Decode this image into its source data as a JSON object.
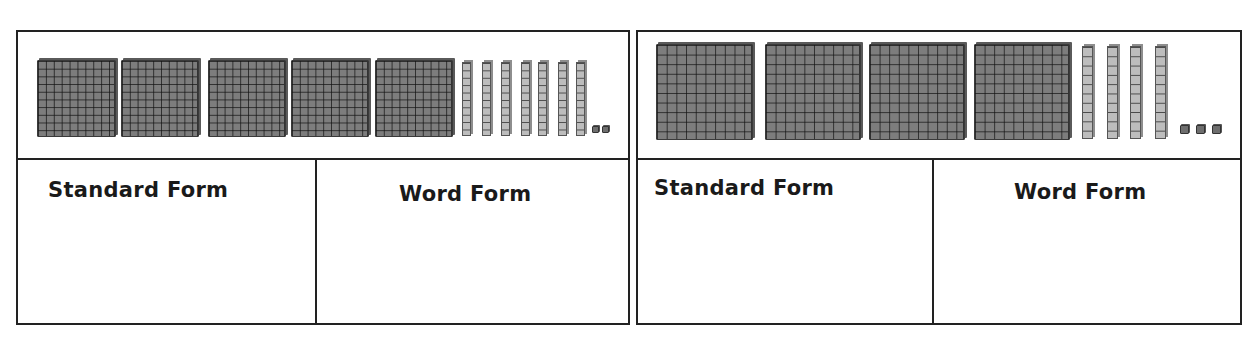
{
  "cards": [
    {
      "id": "left",
      "represented_number": 572,
      "blocks": {
        "hundreds": 5,
        "tens": 7,
        "ones": 2
      },
      "standard_form_label": "Standard Form",
      "word_form_label": "Word Form",
      "standard_form_value": "",
      "word_form_value": ""
    },
    {
      "id": "right",
      "represented_number": 443,
      "blocks": {
        "hundreds": 4,
        "tens": 4,
        "ones": 3
      },
      "standard_form_label": "Standard Form",
      "word_form_label": "Word Form",
      "standard_form_value": "",
      "word_form_value": ""
    }
  ],
  "colors": {
    "border": "#222222",
    "hundred_flat": "#7d7d7d",
    "ten_rod": "#bdbdbd",
    "one_unit": "#6e6e6e"
  }
}
